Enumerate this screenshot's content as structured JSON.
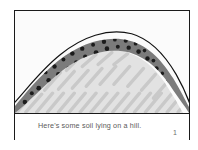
{
  "figure": {
    "caption": "Here's some soil lying on a hill.",
    "page_number": "1",
    "colors": {
      "frame_border": "#1a1a1a",
      "soil_layer": "#7b7b7b",
      "rock_dot": "#1c1c1c",
      "bedrock_fill": "#e2e2e2",
      "bedrock_hatch": "#c9c9c9",
      "sky": "#fbfbfb",
      "outline": "#111111",
      "caption_text": "#5a5a5a"
    },
    "scene": {
      "label": "cross-section of a hill showing a soil layer over bedrock",
      "sky_label": "sky",
      "soil_label": "soil layer",
      "bedrock_label": "bedrock",
      "hill_outline_label": "hill surface outline",
      "rock_count": 44,
      "hatch_count": 22,
      "soil_top_path": "M 0 96 C 10 84 24 66 44 50 C 66 33 92 24 116 30 C 136 35 150 52 160 68 C 168 81 172 90 176 97",
      "soil_bottom_path": "M 0 103 C 12 94 28 76 48 60 C 68 45 92 36 114 42 C 133 48 146 63 155 78 C 162 89 166 96 170 103",
      "surface_outline_path": "M 0 92 C 12 79 26 60 46 44 C 68 26 94 17 118 23 C 139 29 153 47 163 64 C 171 78 175 88 178 97",
      "rocks": [
        {
          "cx": 10,
          "cy": 92,
          "r": 2.3
        },
        {
          "cx": 17,
          "cy": 83,
          "r": 2.0
        },
        {
          "cx": 14,
          "cy": 96,
          "r": 1.8
        },
        {
          "cx": 24,
          "cy": 78,
          "r": 2.4
        },
        {
          "cx": 30,
          "cy": 84,
          "r": 2.1
        },
        {
          "cx": 22,
          "cy": 90,
          "r": 1.7
        },
        {
          "cx": 34,
          "cy": 70,
          "r": 2.3
        },
        {
          "cx": 40,
          "cy": 76,
          "r": 2.0
        },
        {
          "cx": 31,
          "cy": 62,
          "r": 1.9
        },
        {
          "cx": 44,
          "cy": 64,
          "r": 2.5
        },
        {
          "cx": 50,
          "cy": 70,
          "r": 1.9
        },
        {
          "cx": 40,
          "cy": 56,
          "r": 2.2
        },
        {
          "cx": 54,
          "cy": 58,
          "r": 2.1
        },
        {
          "cx": 58,
          "cy": 65,
          "r": 2.3
        },
        {
          "cx": 49,
          "cy": 49,
          "r": 2.0
        },
        {
          "cx": 62,
          "cy": 52,
          "r": 2.2
        },
        {
          "cx": 66,
          "cy": 60,
          "r": 1.8
        },
        {
          "cx": 58,
          "cy": 43,
          "r": 2.3
        },
        {
          "cx": 71,
          "cy": 46,
          "r": 2.1
        },
        {
          "cx": 76,
          "cy": 54,
          "r": 2.0
        },
        {
          "cx": 68,
          "cy": 38,
          "r": 2.2
        },
        {
          "cx": 82,
          "cy": 42,
          "r": 2.4
        },
        {
          "cx": 86,
          "cy": 50,
          "r": 1.9
        },
        {
          "cx": 79,
          "cy": 34,
          "r": 2.0
        },
        {
          "cx": 93,
          "cy": 38,
          "r": 2.3
        },
        {
          "cx": 97,
          "cy": 47,
          "r": 2.1
        },
        {
          "cx": 90,
          "cy": 31,
          "r": 2.2
        },
        {
          "cx": 104,
          "cy": 36,
          "r": 2.0
        },
        {
          "cx": 108,
          "cy": 45,
          "r": 2.3
        },
        {
          "cx": 101,
          "cy": 29,
          "r": 1.9
        },
        {
          "cx": 115,
          "cy": 37,
          "r": 2.2
        },
        {
          "cx": 118,
          "cy": 46,
          "r": 2.0
        },
        {
          "cx": 112,
          "cy": 30,
          "r": 2.1
        },
        {
          "cx": 125,
          "cy": 41,
          "r": 2.3
        },
        {
          "cx": 128,
          "cy": 51,
          "r": 2.0
        },
        {
          "cx": 122,
          "cy": 33,
          "r": 1.9
        },
        {
          "cx": 134,
          "cy": 48,
          "r": 2.2
        },
        {
          "cx": 137,
          "cy": 58,
          "r": 2.1
        },
        {
          "cx": 131,
          "cy": 40,
          "r": 1.8
        },
        {
          "cx": 143,
          "cy": 58,
          "r": 2.3
        },
        {
          "cx": 146,
          "cy": 68,
          "r": 2.0
        },
        {
          "cx": 140,
          "cy": 50,
          "r": 1.9
        },
        {
          "cx": 152,
          "cy": 72,
          "r": 2.2
        },
        {
          "cx": 156,
          "cy": 84,
          "r": 2.1
        },
        {
          "cx": 149,
          "cy": 63,
          "r": 1.8
        },
        {
          "cx": 161,
          "cy": 90,
          "r": 2.0
        },
        {
          "cx": 164,
          "cy": 99,
          "r": 1.9
        }
      ],
      "hatches": [
        {
          "x1": 2,
          "y1": 102,
          "x2": 16,
          "y2": 86
        },
        {
          "x1": 11,
          "y1": 102,
          "x2": 27,
          "y2": 84
        },
        {
          "x1": 22,
          "y1": 102,
          "x2": 38,
          "y2": 83
        },
        {
          "x1": 33,
          "y1": 102,
          "x2": 49,
          "y2": 83
        },
        {
          "x1": 44,
          "y1": 102,
          "x2": 60,
          "y2": 83
        },
        {
          "x1": 55,
          "y1": 102,
          "x2": 71,
          "y2": 83
        },
        {
          "x1": 66,
          "y1": 102,
          "x2": 82,
          "y2": 83
        },
        {
          "x1": 77,
          "y1": 102,
          "x2": 93,
          "y2": 83
        },
        {
          "x1": 88,
          "y1": 102,
          "x2": 104,
          "y2": 83
        },
        {
          "x1": 99,
          "y1": 102,
          "x2": 115,
          "y2": 83
        },
        {
          "x1": 110,
          "y1": 102,
          "x2": 126,
          "y2": 83
        },
        {
          "x1": 121,
          "y1": 102,
          "x2": 137,
          "y2": 83
        },
        {
          "x1": 132,
          "y1": 102,
          "x2": 148,
          "y2": 83
        },
        {
          "x1": 143,
          "y1": 102,
          "x2": 159,
          "y2": 83
        },
        {
          "x1": 154,
          "y1": 102,
          "x2": 170,
          "y2": 83
        },
        {
          "x1": 165,
          "y1": 102,
          "x2": 176,
          "y2": 89
        },
        {
          "x1": 30,
          "y1": 80,
          "x2": 46,
          "y2": 62
        },
        {
          "x1": 44,
          "y1": 79,
          "x2": 60,
          "y2": 61
        },
        {
          "x1": 58,
          "y1": 78,
          "x2": 74,
          "y2": 60
        },
        {
          "x1": 72,
          "y1": 76,
          "x2": 88,
          "y2": 58
        },
        {
          "x1": 86,
          "y1": 74,
          "x2": 102,
          "y2": 56
        },
        {
          "x1": 100,
          "y1": 74,
          "x2": 116,
          "y2": 56
        },
        {
          "x1": 114,
          "y1": 76,
          "x2": 130,
          "y2": 58
        },
        {
          "x1": 128,
          "y1": 80,
          "x2": 142,
          "y2": 64
        },
        {
          "x1": 140,
          "y1": 88,
          "x2": 152,
          "y2": 74
        },
        {
          "x1": 52,
          "y1": 60,
          "x2": 66,
          "y2": 46
        },
        {
          "x1": 68,
          "y1": 56,
          "x2": 82,
          "y2": 44
        },
        {
          "x1": 84,
          "y1": 54,
          "x2": 98,
          "y2": 42
        },
        {
          "x1": 100,
          "y1": 54,
          "x2": 114,
          "y2": 43
        }
      ]
    }
  }
}
